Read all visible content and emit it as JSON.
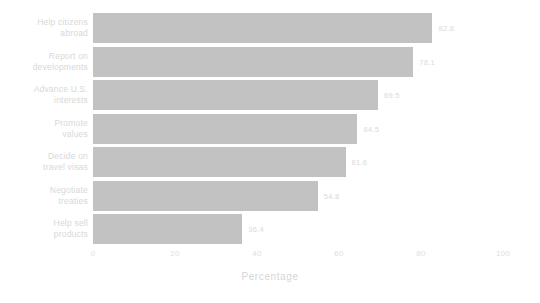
{
  "chart_data": {
    "type": "bar",
    "orientation": "horizontal",
    "title": "",
    "xlabel": "Percentage",
    "ylabel": "",
    "xlim": [
      0,
      100
    ],
    "xticks": [
      "0",
      "20",
      "40",
      "60",
      "80",
      "100"
    ],
    "grid": false,
    "legend": false,
    "bar_color": "#c2c2c2",
    "background_color": "#ffffff",
    "categories": [
      "Help citizens abroad",
      "Report on developments",
      "Advance U.S. interests",
      "Promote values",
      "Decide on travel visas",
      "Negotiate treaties",
      "Help sell products"
    ],
    "values": [
      82.8,
      78.1,
      69.5,
      64.5,
      61.6,
      54.8,
      36.4
    ],
    "bars": [
      {
        "label_line1": "Help citizens",
        "label_line2": "abroad",
        "value": 82.8,
        "value_label": "82.8"
      },
      {
        "label_line1": "Report on",
        "label_line2": "developments",
        "value": 78.1,
        "value_label": "78.1"
      },
      {
        "label_line1": "Advance U.S.",
        "label_line2": "interests",
        "value": 69.5,
        "value_label": "69.5"
      },
      {
        "label_line1": "Promote",
        "label_line2": "values",
        "value": 64.5,
        "value_label": "64.5"
      },
      {
        "label_line1": "Decide on",
        "label_line2": "travel visas",
        "value": 61.6,
        "value_label": "61.6"
      },
      {
        "label_line1": "Negotiate",
        "label_line2": "treaties",
        "value": 54.8,
        "value_label": "54.8"
      },
      {
        "label_line1": "Help sell",
        "label_line2": "products",
        "value": 36.4,
        "value_label": "36.4"
      }
    ]
  }
}
